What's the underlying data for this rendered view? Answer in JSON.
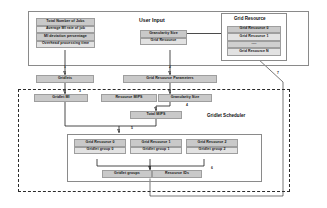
{
  "diagram": {
    "user_input": {
      "section_label": "User Input",
      "job_parameters": [
        "Total Number of Jobs",
        "Average MI rate of job",
        "MI deviation percentage",
        "Overhead processing time"
      ],
      "input_fields": [
        "Granularity Size",
        "Grid Resource"
      ]
    },
    "grid_resource_box": {
      "title": "Grid Resource",
      "items": [
        "Grid Resource  0",
        "Grid Resource  1",
        "----",
        "Grid Resource  N"
      ]
    },
    "intermediate": {
      "gridlets": "Gridlets",
      "grid_resource_parameters": "Grid Resource  Parameters"
    },
    "scheduler": {
      "section_label": "Gridlet Scheduler",
      "inputs": [
        "Gridlet MI",
        "Resource MIPS",
        "Granularity Size"
      ],
      "total": "Total MIPS",
      "assignments": [
        {
          "resource": "Grid Resource 0",
          "group": "Gridlet group 0"
        },
        {
          "resource": "Grid Resource 1",
          "group": "Gridlet group 1"
        },
        {
          "resource": "Grid Resource 2",
          "group": "Gridlet group 2"
        }
      ],
      "outputs": [
        "Gridlet groups",
        "Resource IDs"
      ]
    },
    "steps": {
      "s1": "1",
      "s2": "2",
      "s3": "3",
      "s4": "4",
      "s5": "5",
      "s6": "6",
      "s7": "7"
    },
    "colors": {
      "cell_fill": "#c9c9c9",
      "cell_fill_light": "#e2e2e2",
      "border": "#9e9e9e",
      "line": "#1d1d1d",
      "panel_border": "#8a8a8a",
      "dashed_border": "#2b2b2b"
    }
  }
}
